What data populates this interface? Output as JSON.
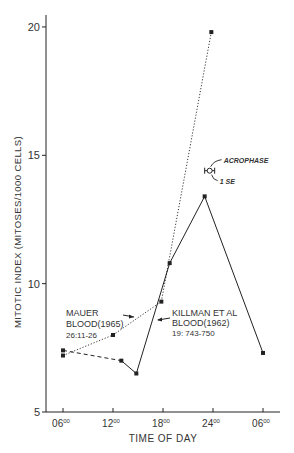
{
  "chart_data": {
    "type": "line",
    "title": "",
    "xlabel": "TIME OF DAY",
    "ylabel": "MITOTIC INDEX (MITOSES/1000 CELLS)",
    "ylim": [
      5,
      20
    ],
    "xlim_hours": [
      4,
      32
    ],
    "y_ticks": [
      {
        "value": 5,
        "label": "5"
      },
      {
        "value": 10,
        "label": "10"
      },
      {
        "value": 15,
        "label": "15"
      },
      {
        "value": 20,
        "label": "20"
      }
    ],
    "x_ticks": [
      {
        "hour": 6,
        "label": "06",
        "sup": "00"
      },
      {
        "hour": 12,
        "label": "12",
        "sup": "00"
      },
      {
        "hour": 18,
        "label": "18",
        "sup": "00"
      },
      {
        "hour": 24,
        "label": "24",
        "sup": "00"
      },
      {
        "hour": 30,
        "label": "06",
        "sup": "00"
      }
    ],
    "grid": false,
    "series": [
      {
        "name": "Mauer Blood (1965) 26:11-26",
        "style": "dotted",
        "points": [
          {
            "hour": 6,
            "value": 7.2
          },
          {
            "hour": 12,
            "value": 8.0
          },
          {
            "hour": 17.8,
            "value": 9.3
          },
          {
            "hour": 23.8,
            "value": 19.8
          }
        ]
      },
      {
        "name": "Killman et al Blood (1962) 19:743-750",
        "style": "dashed-then-solid",
        "points": [
          {
            "hour": 6,
            "value": 7.4
          },
          {
            "hour": 13,
            "value": 7.0
          },
          {
            "hour": 14.8,
            "value": 6.5
          },
          {
            "hour": 18.8,
            "value": 10.8
          },
          {
            "hour": 23,
            "value": 13.4
          },
          {
            "hour": 30,
            "value": 7.3
          }
        ],
        "dashed_segments_upto_index": 1
      }
    ],
    "acrophase": {
      "hour": 23.6,
      "value": 14.4,
      "se_hours": 0.6
    }
  },
  "annotations": {
    "mauer": [
      "MAUER",
      "BLOOD(1965)",
      "26:11-26"
    ],
    "killman": [
      "KILLMAN ET AL",
      "BLOOD(1962)",
      "19: 743-750"
    ],
    "acrophase_label": "ACROPHASE",
    "se_label": "1 SE"
  },
  "colors": {
    "ink": "#222222",
    "text": "#444444",
    "background": "#ffffff"
  }
}
